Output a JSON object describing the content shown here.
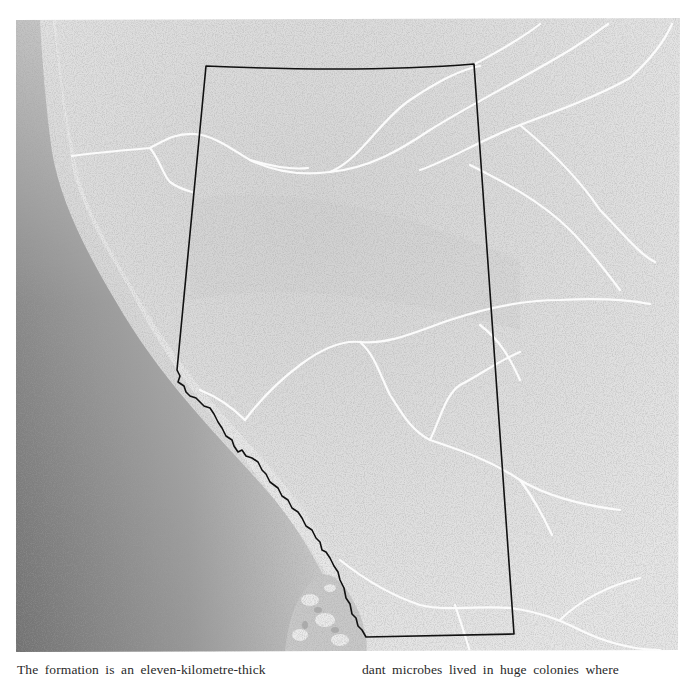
{
  "figure": {
    "region_outline": "province-boundary",
    "colors": {
      "paper": "#ffffff",
      "plains": "#e2e2e2",
      "mountains": "#8c8c8c",
      "boundary": "#111111",
      "rivers": "#fafafa"
    }
  },
  "caption": {
    "column_left": "The formation is an eleven-kilometre-thick",
    "column_right": "dant microbes lived in huge colonies where"
  }
}
